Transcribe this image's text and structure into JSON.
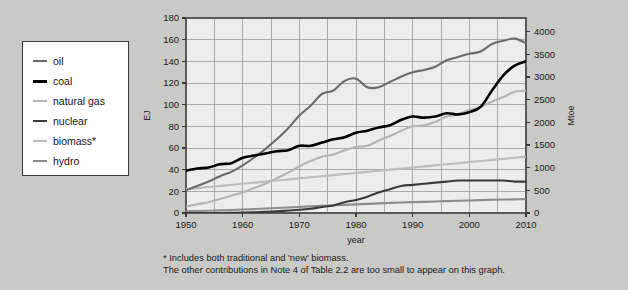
{
  "figure": {
    "background_color": "#c9c9c6",
    "plot_background_color": "#f2f2f0",
    "grid_color": "#9a9a9a"
  },
  "legend": {
    "name": "energy-sources-legend",
    "items": [
      {
        "label": "oil",
        "color": "#6b6b6b",
        "width": 2.6
      },
      {
        "label": "coal",
        "color": "#000000",
        "width": 3.0
      },
      {
        "label": "natural gas",
        "color": "#b4b4b4",
        "width": 2.6
      },
      {
        "label": "nuclear",
        "color": "#3a3a3a",
        "width": 2.6
      },
      {
        "label": "biomass*",
        "color": "#bdbdbd",
        "width": 2.6
      },
      {
        "label": "hydro",
        "color": "#8d8d8d",
        "width": 2.6
      }
    ]
  },
  "footnote": {
    "line1": "* Includes both traditional and 'new' biomass.",
    "line2": "The other contributions in Note 4 of Table 2.2 are too small to appear on this graph."
  },
  "chart_data": {
    "type": "line",
    "title": "",
    "xlabel": "year",
    "ylabel": "EJ",
    "y2label": "Mtoe",
    "xlim": [
      1950,
      2010
    ],
    "ylim": [
      0,
      180
    ],
    "y2lim": [
      0,
      4300
    ],
    "xticks": [
      1950,
      1960,
      1970,
      1980,
      1990,
      2000,
      2010
    ],
    "yticks": [
      0,
      20,
      40,
      60,
      80,
      100,
      120,
      140,
      160,
      180
    ],
    "y2ticks": [
      0,
      500,
      1000,
      1500,
      2000,
      2500,
      3000,
      3500,
      4000
    ],
    "grid": true,
    "legend_position": "outside-left",
    "x": [
      1950,
      1952,
      1954,
      1956,
      1958,
      1960,
      1962,
      1964,
      1966,
      1968,
      1970,
      1972,
      1974,
      1976,
      1978,
      1980,
      1982,
      1984,
      1986,
      1988,
      1990,
      1992,
      1994,
      1996,
      1998,
      2000,
      2002,
      2004,
      2006,
      2008,
      2010
    ],
    "series": [
      {
        "name": "oil",
        "color": "#6b6b6b",
        "values": [
          21,
          25,
          29,
          34,
          38,
          44,
          51,
          59,
          68,
          78,
          90,
          99,
          110,
          113,
          122,
          124,
          116,
          116,
          121,
          126,
          130,
          132,
          135,
          141,
          144,
          147,
          149,
          156,
          159,
          161,
          157
        ]
      },
      {
        "name": "coal",
        "color": "#000000",
        "values": [
          39,
          41,
          42,
          45,
          46,
          51,
          53,
          55,
          57,
          58,
          62,
          62,
          65,
          68,
          70,
          74,
          76,
          79,
          81,
          86,
          89,
          88,
          89,
          92,
          91,
          93,
          98,
          113,
          127,
          136,
          140
        ]
      },
      {
        "name": "natural gas",
        "color": "#b4b4b4",
        "values": [
          6,
          8,
          10,
          13,
          16,
          19,
          23,
          27,
          32,
          37,
          43,
          48,
          52,
          54,
          58,
          61,
          62,
          67,
          71,
          76,
          80,
          81,
          84,
          89,
          91,
          95,
          98,
          103,
          107,
          112,
          113
        ]
      },
      {
        "name": "nuclear",
        "color": "#3a3a3a",
        "values": [
          0,
          0,
          0,
          0,
          0.2,
          0.4,
          0.7,
          1,
          1.5,
          2.3,
          3,
          4,
          5.5,
          7,
          10,
          12,
          15,
          19,
          22,
          25,
          26,
          27,
          28,
          29,
          30,
          30,
          30,
          30,
          30,
          29,
          29
        ]
      },
      {
        "name": "biomass*",
        "color": "#bdbdbd",
        "values": [
          22,
          23,
          24,
          25,
          26,
          27,
          28,
          29,
          30,
          31,
          32,
          33,
          34,
          35,
          36,
          37,
          38,
          39,
          40,
          41,
          42,
          43,
          44,
          45,
          46,
          47,
          48,
          49,
          50,
          51,
          52
        ]
      },
      {
        "name": "hydro",
        "color": "#8d8d8d",
        "values": [
          1.5,
          1.8,
          2.1,
          2.4,
          2.8,
          3.2,
          3.6,
          4.1,
          4.6,
          5.1,
          5.6,
          6.1,
          6.6,
          7.0,
          7.5,
          8.0,
          8.4,
          8.9,
          9.3,
          9.7,
          10.0,
          10.3,
          10.6,
          11.0,
          11.3,
          11.6,
          11.9,
          12.2,
          12.4,
          12.6,
          12.8
        ]
      }
    ]
  }
}
